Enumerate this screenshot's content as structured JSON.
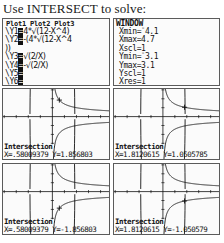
{
  "header": {
    "title": "Use INTERSECT to solve:"
  },
  "y_editor": {
    "plot_tabs": [
      "Plot1",
      "Plot2",
      "Plot3"
    ],
    "equations": [
      {
        "name": "\\Y1",
        "eq": "4*√(12-X^4)"
      },
      {
        "name": "\\Y2",
        "eq": "-(4*√(12-X^4"
      },
      {
        "name": "",
        "eq": "))"
      },
      {
        "name": "\\Y3",
        "eq": "√(2/X)"
      },
      {
        "name": "\\Y4",
        "eq": "-√(2/X)"
      },
      {
        "name": "\\Y5",
        "eq": ""
      },
      {
        "name": "\\Y6",
        "eq": ""
      }
    ]
  },
  "window": {
    "title": "WINDOW",
    "settings": [
      {
        "key": "Xmin",
        "value": "-4.1",
        "negative": true
      },
      {
        "key": "Xmax",
        "value": "4.7",
        "negative": false
      },
      {
        "key": "Xscl",
        "value": "1",
        "negative": false
      },
      {
        "key": "Ymin",
        "value": "-3.1",
        "negative": true
      },
      {
        "key": "Ymax",
        "value": "3.1",
        "negative": false
      },
      {
        "key": "Yscl",
        "value": "1",
        "negative": false
      },
      {
        "key": "Xres",
        "value": "1",
        "negative": false
      }
    ]
  },
  "graphs": [
    {
      "id": "graph-top-left",
      "label": "Intersection",
      "x_label": "X=",
      "x_value": ".58009379",
      "y_label": "Y=",
      "y_value": "1.856803",
      "cursor_x": 0.58009379,
      "cursor_y": 1.856803
    },
    {
      "id": "graph-top-right",
      "label": "Intersection",
      "x_label": "X=",
      "x_value": "1.8120615",
      "y_label": "Y=",
      "y_value": "1.0505785",
      "cursor_x": 1.8120615,
      "cursor_y": 1.0505785
    },
    {
      "id": "graph-bottom-left",
      "label": "Intersection",
      "x_label": "X=",
      "x_value": ".58009379",
      "y_label": "Y=",
      "y_value": "-1.856803",
      "cursor_x": 0.58009379,
      "cursor_y": -1.856803
    },
    {
      "id": "graph-bottom-right",
      "label": "Intersection",
      "x_label": "X=",
      "x_value": "1.8120615",
      "y_label": "Y=",
      "y_value": "-1.050579",
      "cursor_x": 1.8120615,
      "cursor_y": -1.050579
    }
  ],
  "chart_data": {
    "type": "line",
    "xlabel": "X",
    "ylabel": "Y",
    "xlim": [
      -4.1,
      4.7
    ],
    "ylim": [
      -3.1,
      3.1
    ],
    "xscl": 1,
    "yscl": 1,
    "grid": false,
    "legend": "none",
    "series": [
      {
        "name": "Y1 = 4*√(12-X^4)",
        "expression": "4*sqrt(12-x^4)"
      },
      {
        "name": "Y2 = -(4*√(12-X^4))",
        "expression": "-4*sqrt(12-x^4)"
      },
      {
        "name": "Y3 = √(2/X)",
        "expression": "sqrt(2/x)"
      },
      {
        "name": "Y4 = -√(2/X)",
        "expression": "-sqrt(2/x)"
      }
    ],
    "annotations": [
      {
        "label": "Intersection",
        "x": 0.58009379,
        "y": 1.856803
      },
      {
        "label": "Intersection",
        "x": 1.8120615,
        "y": 1.0505785
      },
      {
        "label": "Intersection",
        "x": 0.58009379,
        "y": -1.856803
      },
      {
        "label": "Intersection",
        "x": 1.8120615,
        "y": -1.050579
      }
    ]
  }
}
